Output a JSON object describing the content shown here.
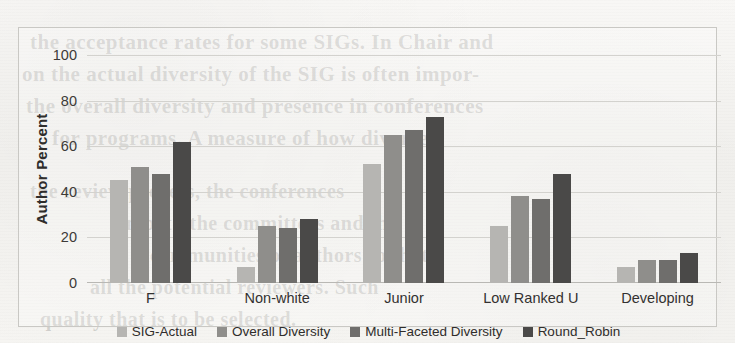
{
  "chart_data": {
    "type": "bar",
    "title": "",
    "subtitle": "",
    "xlabel": "",
    "ylabel": "Author Percent",
    "ylim": [
      0,
      100
    ],
    "yticks": [
      0,
      20,
      40,
      60,
      80,
      100
    ],
    "ytick_labels": [
      "0",
      "20",
      "40",
      "60",
      "80",
      "100"
    ],
    "grid": true,
    "legend_position": "bottom",
    "categories": [
      "F",
      "Non-white",
      "Junior",
      "Low Ranked U",
      "Developing"
    ],
    "series": [
      {
        "name": "SIG-Actual",
        "color": "#b6b5b2",
        "values": [
          45,
          7,
          52,
          25,
          7
        ]
      },
      {
        "name": "Overall Diversity",
        "color": "#8f8e8b",
        "values": [
          51,
          25,
          65,
          38,
          10
        ]
      },
      {
        "name": "Multi-Faceted Diversity",
        "color": "#6f6e6c",
        "values": [
          48,
          24,
          67,
          37,
          10
        ]
      },
      {
        "name": "Round_Robin",
        "color": "#4a4948",
        "values": [
          62,
          28,
          73,
          48,
          13
        ]
      }
    ]
  },
  "background_text": {
    "lines": [
      "the acceptance rates for some SIGs. In Chair and",
      "on the actual diversity of the SIG is often impor-",
      "the overall diversity and presence in conferences",
      "for programs. A measure of how diverse",
      "the review process, the conferences",
      "in both the committees and the",
      "communities of authors so that",
      "all the potential reviewers. Such",
      "quality that is to be selected."
    ]
  }
}
